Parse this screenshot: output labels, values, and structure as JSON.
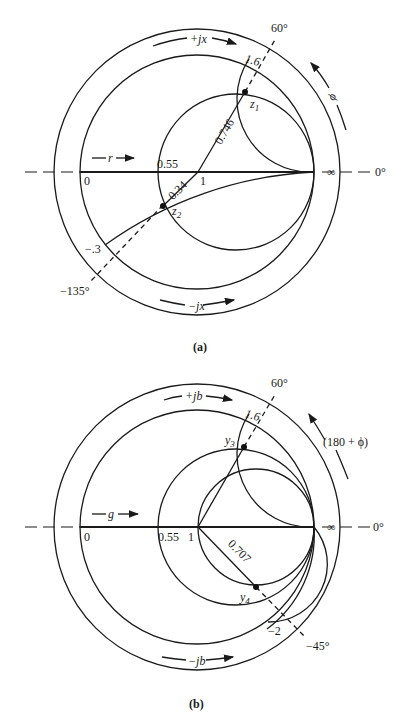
{
  "figure_a": {
    "caption": "(a)",
    "angle_60": "60°",
    "angle_0": "0°",
    "angle_m135": "−135°",
    "infinity": "∞",
    "label_plus_jx": "+jx",
    "label_minus_jx": "−jx",
    "label_r": "r",
    "label_phi": "ϕ",
    "tick_0": "0",
    "tick_055": "0.55",
    "tick_1": "1",
    "reactance_16": "1.6",
    "reactance_m03": "−.3",
    "radius_0746": "0.746",
    "radius_034": "0.34",
    "point_z1": "z",
    "point_z1_sub": "1",
    "point_z2": "z",
    "point_z2_sub": "2"
  },
  "figure_b": {
    "caption": "(b)",
    "angle_60": "60°",
    "angle_0": "0°",
    "angle_m45": "−45°",
    "infinity": "∞",
    "label_plus_jb": "+jb",
    "label_minus_jb": "−jb",
    "label_g": "g",
    "label_phi": "(180 + ϕ)",
    "tick_0": "0",
    "tick_055": "0.55",
    "tick_1": "1",
    "susceptance_16": "1.6",
    "susceptance_m2": "−2",
    "radius_0707": "0.707",
    "point_y3": "y",
    "point_y3_sub": "3",
    "point_y4": "y",
    "point_y4_sub": "4"
  }
}
